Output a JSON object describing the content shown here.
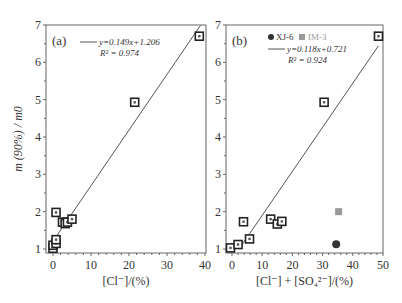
{
  "chart_data": [
    {
      "type": "scatter",
      "panel_label": "(a)",
      "xlabel": "[Cl⁻]/(%)",
      "ylabel": "m (90%) / m0",
      "xlim": [
        -2,
        40
      ],
      "ylim": [
        0.9,
        7
      ],
      "xticks": [
        "0",
        "10",
        "20",
        "30",
        "40"
      ],
      "yticks": [
        "1",
        "2",
        "3",
        "4",
        "5",
        "6",
        "7"
      ],
      "fit": {
        "equation": "y=0.149x+1.206",
        "r2": "R² = 0.974",
        "slope": 0.149,
        "intercept": 1.206
      },
      "points": [
        {
          "x": 0,
          "y": 1.02
        },
        {
          "x": 0,
          "y": 1.1
        },
        {
          "x": 0.8,
          "y": 1.15
        },
        {
          "x": 0.8,
          "y": 1.25
        },
        {
          "x": 0.8,
          "y": 1.98
        },
        {
          "x": 2.5,
          "y": 1.72
        },
        {
          "x": 3.2,
          "y": 1.68
        },
        {
          "x": 3.8,
          "y": 1.72
        },
        {
          "x": 5.0,
          "y": 1.8
        },
        {
          "x": 21.5,
          "y": 4.93
        },
        {
          "x": 38.5,
          "y": 6.7
        }
      ]
    },
    {
      "type": "scatter",
      "panel_label": "(b)",
      "xlabel": "[Cl⁻] + [SO₄²⁻]/(%)",
      "ylabel": "",
      "xlim": [
        -2,
        50
      ],
      "ylim": [
        0.9,
        7
      ],
      "xticks": [
        "0",
        "10",
        "20",
        "30",
        "40",
        "50"
      ],
      "yticks": [
        "1",
        "2",
        "3",
        "4",
        "5",
        "6",
        "7"
      ],
      "legend": [
        {
          "label": "XJ-6",
          "marker": "circle",
          "color": "#333333"
        },
        {
          "label": "IM-3",
          "marker": "square",
          "color": "#999999"
        }
      ],
      "fit": {
        "equation": "y=0.118x+0.721",
        "r2": "R² = 0.924",
        "slope": 0.118,
        "intercept": 0.721
      },
      "points": [
        {
          "x": -0.5,
          "y": 1.03
        },
        {
          "x": 2.0,
          "y": 1.12
        },
        {
          "x": 5.8,
          "y": 1.27
        },
        {
          "x": 3.8,
          "y": 1.73
        },
        {
          "x": 12.8,
          "y": 1.8
        },
        {
          "x": 15.0,
          "y": 1.67
        },
        {
          "x": 16.5,
          "y": 1.74
        },
        {
          "x": 30.5,
          "y": 4.93
        },
        {
          "x": 48.5,
          "y": 6.7
        }
      ],
      "special_points": [
        {
          "series": "XJ-6",
          "x": 34.5,
          "y": 1.13
        },
        {
          "series": "IM-3",
          "x": 35.3,
          "y": 2.0
        }
      ]
    }
  ]
}
